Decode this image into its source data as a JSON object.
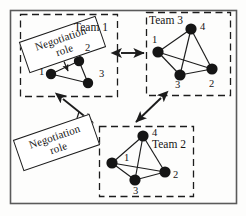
{
  "figure": {
    "background_color": "#fdfdfc",
    "line_color": "#1c1c1c",
    "node_color": "#151515",
    "outer_frame": {
      "x": 10,
      "y": 10,
      "width": 226,
      "height": 193
    }
  },
  "annotations": {
    "negotiation_role_1": {
      "line1": "Negotiation",
      "line2": "role"
    },
    "negotiation_role_2": {
      "line1": "Negotiation",
      "line2": "role"
    }
  },
  "teams": [
    {
      "id": "team1",
      "label": "Team 1",
      "box": {
        "x": 20,
        "y": 14,
        "width": 97,
        "height": 82
      },
      "label_pos": {
        "x": 74,
        "y": 22
      },
      "nodes": [
        {
          "id": 1,
          "label": "1",
          "cx": 51,
          "cy": 74,
          "r": 5.2,
          "label_pos": {
            "x": 39,
            "y": 67
          }
        },
        {
          "id": 2,
          "label": "2",
          "cx": 79,
          "cy": 61,
          "r": 5.2,
          "label_pos": {
            "x": 85,
            "y": 43
          }
        },
        {
          "id": 3,
          "label": "3",
          "cx": 88,
          "cy": 83,
          "r": 5.2,
          "label_pos": {
            "x": 99,
            "y": 69
          }
        }
      ],
      "edges": [
        [
          1,
          2
        ],
        [
          1,
          3
        ],
        [
          2,
          3
        ]
      ]
    },
    {
      "id": "team3",
      "label": "Team 3",
      "box": {
        "x": 146,
        "y": 12,
        "width": 84,
        "height": 83
      },
      "label_pos": {
        "x": 149,
        "y": 15
      },
      "nodes": [
        {
          "id": 1,
          "label": "1",
          "cx": 158,
          "cy": 52,
          "r": 5.6,
          "label_pos": {
            "x": 152,
            "y": 35
          }
        },
        {
          "id": 4,
          "label": "4",
          "cx": 191,
          "cy": 29,
          "r": 5.6,
          "label_pos": {
            "x": 200,
            "y": 22
          }
        },
        {
          "id": 3,
          "label": "3",
          "cx": 180,
          "cy": 75,
          "r": 5.6,
          "label_pos": {
            "x": 175,
            "y": 80
          }
        },
        {
          "id": 2,
          "label": "2",
          "cx": 212,
          "cy": 69,
          "r": 5.6,
          "label_pos": {
            "x": 209,
            "y": 79
          }
        }
      ],
      "edges": [
        [
          1,
          4
        ],
        [
          1,
          3
        ],
        [
          1,
          2
        ],
        [
          4,
          3
        ],
        [
          4,
          2
        ],
        [
          3,
          2
        ]
      ]
    },
    {
      "id": "team2",
      "label": "Team 2",
      "box": {
        "x": 99,
        "y": 126,
        "width": 94,
        "height": 70
      },
      "label_pos": {
        "x": 152,
        "y": 139
      },
      "nodes": [
        {
          "id": 4,
          "label": "4",
          "cx": 143,
          "cy": 136,
          "r": 5.6,
          "label_pos": {
            "x": 152,
            "y": 128
          }
        },
        {
          "id": 1,
          "label": "1",
          "cx": 112,
          "cy": 163,
          "r": 5.6,
          "label_pos": {
            "x": 124,
            "y": 153
          }
        },
        {
          "id": 3,
          "label": "3",
          "cx": 135,
          "cy": 180,
          "r": 5.6,
          "label_pos": {
            "x": 133,
            "y": 186
          }
        },
        {
          "id": 2,
          "label": "2",
          "cx": 165,
          "cy": 172,
          "r": 5.6,
          "label_pos": {
            "x": 173,
            "y": 170
          }
        }
      ],
      "edges": [
        [
          4,
          1
        ],
        [
          4,
          3
        ],
        [
          4,
          2
        ],
        [
          1,
          3
        ],
        [
          1,
          2
        ],
        [
          3,
          2
        ]
      ]
    }
  ],
  "connectors": [
    {
      "id": "team1-team3",
      "from": "team1",
      "to": "team3",
      "kind": "double-arrow",
      "x1": 121,
      "y1": 53,
      "x2": 144,
      "y2": 53
    },
    {
      "id": "team1-team2",
      "from": "team1",
      "to": "team2",
      "kind": "double-arrow",
      "x1": 63,
      "y1": 99,
      "x2": 93,
      "y2": 123
    },
    {
      "id": "team3-team2",
      "from": "team3",
      "to": "team2",
      "kind": "double-arrow",
      "x1": 161,
      "y1": 98,
      "x2": 136,
      "y2": 122
    }
  ],
  "pointers": [
    {
      "id": "role1-to-team1-node1",
      "kind": "arrow",
      "x1": 60,
      "y1": 52,
      "x2": 68,
      "y2": 71
    },
    {
      "id": "role2-to-connector",
      "kind": "line",
      "x1": 70,
      "y1": 140,
      "x2": 79,
      "y2": 112
    }
  ]
}
